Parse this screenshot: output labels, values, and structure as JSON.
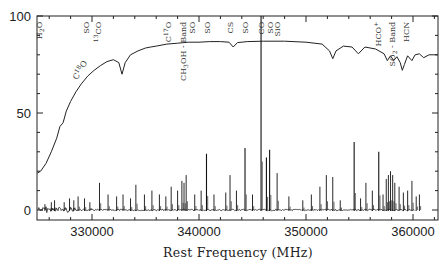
{
  "chart_data": {
    "type": "line",
    "title": "",
    "xlabel": "Rest Frequency (MHz)",
    "ylabel": "",
    "xlim": [
      324900,
      362300
    ],
    "ylim": [
      -4,
      100
    ],
    "grid": false,
    "legend": null,
    "x_ticks": [
      330000,
      340000,
      350000,
      360000
    ],
    "x_tick_labels": [
      "330000",
      "340000",
      "350000",
      "360000"
    ],
    "x_minor_step": 2000,
    "y_ticks": [
      0,
      50,
      100
    ],
    "y_tick_labels": [
      "0",
      "50",
      "100"
    ],
    "y_minor_step": 10,
    "series": [
      {
        "name": "Atmospheric transmission",
        "description": "Upper smooth curve rising from ~19% at 325 GHz to ~87% plateau with absorption dips",
        "points": [
          [
            324900,
            19
          ],
          [
            325200,
            20
          ],
          [
            325700,
            24
          ],
          [
            326200,
            30
          ],
          [
            326700,
            37
          ],
          [
            327000,
            43
          ],
          [
            327300,
            45
          ],
          [
            327600,
            51
          ],
          [
            328000,
            56
          ],
          [
            328500,
            61
          ],
          [
            329000,
            65
          ],
          [
            329600,
            69
          ],
          [
            330200,
            72
          ],
          [
            330800,
            74.5
          ],
          [
            331400,
            76.5
          ],
          [
            332000,
            77.5
          ],
          [
            332500,
            76
          ],
          [
            332800,
            70
          ],
          [
            333100,
            76
          ],
          [
            333600,
            80
          ],
          [
            334300,
            82
          ],
          [
            335000,
            83.5
          ],
          [
            335500,
            84
          ],
          [
            336000,
            84.5
          ],
          [
            337000,
            85.5
          ],
          [
            338000,
            86
          ],
          [
            339000,
            86.5
          ],
          [
            340000,
            86.5
          ],
          [
            341000,
            86.8
          ],
          [
            342000,
            86.8
          ],
          [
            342800,
            86.5
          ],
          [
            343200,
            84
          ],
          [
            343600,
            86.3
          ],
          [
            344500,
            86.8
          ],
          [
            346000,
            87
          ],
          [
            348000,
            87
          ],
          [
            350000,
            86.5
          ],
          [
            351500,
            85.5
          ],
          [
            352200,
            82
          ],
          [
            352500,
            78
          ],
          [
            352800,
            82
          ],
          [
            353500,
            84.5
          ],
          [
            354300,
            84
          ],
          [
            354900,
            80.5
          ],
          [
            355500,
            84
          ],
          [
            356500,
            83
          ],
          [
            357300,
            80.5
          ],
          [
            357600,
            77
          ],
          [
            357900,
            79.5
          ],
          [
            358200,
            77
          ],
          [
            358500,
            79
          ],
          [
            358800,
            76
          ],
          [
            359000,
            72
          ],
          [
            359200,
            75
          ],
          [
            359500,
            79.5
          ],
          [
            359900,
            77
          ],
          [
            360200,
            80
          ],
          [
            360600,
            80.5
          ],
          [
            361000,
            78.5
          ],
          [
            361500,
            80
          ],
          [
            362300,
            80
          ]
        ]
      },
      {
        "name": "Line spectrum",
        "description": "Lower spectrum near zero baseline with many emission lines",
        "baseline": 0,
        "peaks": [
          [
            325600,
            3
          ],
          [
            326200,
            4
          ],
          [
            326500,
            5
          ],
          [
            327400,
            4
          ],
          [
            327900,
            6
          ],
          [
            328300,
            5
          ],
          [
            328700,
            7
          ],
          [
            329300,
            6
          ],
          [
            329800,
            4
          ],
          [
            330700,
            14
          ],
          [
            331500,
            8
          ],
          [
            332300,
            7
          ],
          [
            332900,
            8
          ],
          [
            333600,
            6
          ],
          [
            334100,
            13
          ],
          [
            334900,
            8
          ],
          [
            335600,
            10
          ],
          [
            336300,
            8
          ],
          [
            336900,
            7
          ],
          [
            337400,
            12
          ],
          [
            338000,
            10
          ],
          [
            338400,
            15
          ],
          [
            338600,
            14
          ],
          [
            338800,
            18
          ],
          [
            339600,
            8
          ],
          [
            340200,
            10
          ],
          [
            340700,
            29
          ],
          [
            341400,
            8
          ],
          [
            342500,
            9
          ],
          [
            342900,
            18
          ],
          [
            343500,
            10
          ],
          [
            344300,
            32
          ],
          [
            345000,
            8
          ],
          [
            345800,
            100
          ],
          [
            346300,
            27
          ],
          [
            346600,
            31
          ],
          [
            347300,
            19
          ],
          [
            348400,
            7
          ],
          [
            349700,
            5
          ],
          [
            350500,
            8
          ],
          [
            351300,
            12
          ],
          [
            351900,
            18
          ],
          [
            352500,
            17
          ],
          [
            353200,
            5
          ],
          [
            354500,
            35
          ],
          [
            355100,
            6
          ],
          [
            355600,
            14
          ],
          [
            356200,
            10
          ],
          [
            356800,
            30
          ],
          [
            357200,
            8
          ],
          [
            357500,
            16
          ],
          [
            357700,
            18
          ],
          [
            357900,
            20
          ],
          [
            358100,
            18
          ],
          [
            358300,
            14
          ],
          [
            358700,
            12
          ],
          [
            359100,
            9
          ],
          [
            359500,
            10
          ],
          [
            359900,
            15
          ],
          [
            360300,
            7
          ],
          [
            360600,
            8
          ]
        ]
      }
    ],
    "annotations": [
      {
        "text": "H2O",
        "x": 325000,
        "y": 97,
        "rotate": -90,
        "sub": "2",
        "kind": "line-id"
      },
      {
        "text": "SO",
        "x": 329400,
        "y": 97,
        "rotate": -90,
        "kind": "line-id"
      },
      {
        "text": "13CO",
        "x": 330600,
        "y": 97,
        "rotate": -90,
        "kind": "line-id"
      },
      {
        "text": "C18O",
        "x": 329300,
        "y": 78,
        "rotate": -60,
        "kind": "line-id"
      },
      {
        "text": "C17O",
        "x": 337100,
        "y": 97,
        "rotate": -90,
        "kind": "line-id"
      },
      {
        "text": "CH3OH - Band",
        "x": 338500,
        "y": 97,
        "rotate": -90,
        "kind": "line-id"
      },
      {
        "text": "SO",
        "x": 339300,
        "y": 97,
        "rotate": -90,
        "kind": "line-id"
      },
      {
        "text": "SO",
        "x": 340700,
        "y": 97,
        "rotate": -90,
        "kind": "line-id"
      },
      {
        "text": "CS",
        "x": 342900,
        "y": 97,
        "rotate": -90,
        "kind": "line-id"
      },
      {
        "text": "SO",
        "x": 344300,
        "y": 97,
        "rotate": -90,
        "kind": "line-id"
      },
      {
        "text": "CO",
        "x": 345800,
        "y": 97,
        "rotate": -90,
        "kind": "line-id"
      },
      {
        "text": "SO",
        "x": 346600,
        "y": 97,
        "rotate": -90,
        "kind": "line-id"
      },
      {
        "text": "SiO",
        "x": 347300,
        "y": 97,
        "rotate": -90,
        "kind": "line-id"
      },
      {
        "text": "HCO+",
        "x": 356700,
        "y": 97,
        "rotate": -90,
        "kind": "line-id"
      },
      {
        "text": "SO2 - Band",
        "x": 358000,
        "y": 97,
        "rotate": -90,
        "kind": "line-id"
      },
      {
        "text": "HCN",
        "x": 359300,
        "y": 97,
        "rotate": -90,
        "kind": "line-id"
      }
    ]
  },
  "labels": {
    "xlabel": "Rest Frequency (MHz)",
    "y100": "100",
    "y50": "50",
    "y0": "0",
    "x330": "330000",
    "x340": "340000",
    "x350": "350000",
    "x360": "360000"
  }
}
